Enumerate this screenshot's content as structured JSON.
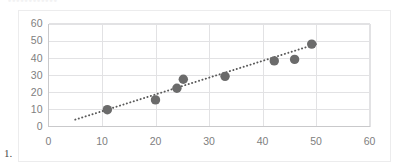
{
  "page": {
    "list_marker": "1.",
    "ghost_heading": "••••••••••••"
  },
  "colors": {
    "point_fill": "#6b6b6b",
    "trendline": "#5a5a5a",
    "gridline": "#e2e2e4",
    "axis_line": "#c9c9cb",
    "tick_label": "#808080",
    "frame_border": "#ececed",
    "background": "#ffffff"
  },
  "chart_data": {
    "type": "scatter",
    "title": "",
    "subtitle": "",
    "xlabel": "",
    "ylabel": "",
    "xlim": [
      0,
      60
    ],
    "ylim": [
      0,
      60
    ],
    "xticks": [
      0,
      10,
      20,
      30,
      40,
      50,
      60
    ],
    "yticks": [
      0,
      10,
      20,
      30,
      40,
      50,
      60
    ],
    "xtick_labels": [
      "0",
      "10",
      "20",
      "30",
      "40",
      "50",
      "60"
    ],
    "ytick_labels": [
      "0",
      "10",
      "20",
      "30",
      "40",
      "50",
      "60"
    ],
    "grid": true,
    "grid_axes": "both",
    "legend": false,
    "legend_position": "none",
    "marker": "circle",
    "marker_size": 7,
    "series": [
      {
        "name": "Series 1",
        "points": [
          {
            "x": 11.0,
            "y": 9.8
          },
          {
            "x": 20.0,
            "y": 15.5
          },
          {
            "x": 24.0,
            "y": 22.3
          },
          {
            "x": 25.2,
            "y": 27.5
          },
          {
            "x": 33.0,
            "y": 29.2
          },
          {
            "x": 42.2,
            "y": 38.2
          },
          {
            "x": 46.0,
            "y": 39.1
          },
          {
            "x": 49.2,
            "y": 48.0
          }
        ]
      }
    ],
    "trendline": {
      "type": "linear",
      "style": "dotted",
      "x_start": 5.0,
      "y_start": 4.0,
      "x_end": 50.0,
      "y_end": 48.0
    }
  }
}
